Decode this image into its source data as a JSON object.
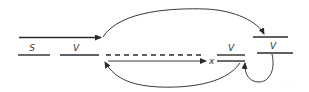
{
  "diagram": {
    "type": "syntactic-movement-diagram",
    "labels": {
      "subject": "S",
      "verb_original": "V",
      "trace_x": "x",
      "verb_target_1": "V",
      "verb_target_2": "V"
    },
    "colors": {
      "ink": "#2b2b2b",
      "background": "#ffffff"
    },
    "elements": [
      {
        "id": "incoming-arrow",
        "kind": "arrow",
        "direction": "right"
      },
      {
        "id": "s-slot",
        "kind": "line",
        "label": "S"
      },
      {
        "id": "v-slot",
        "kind": "line",
        "label": "V"
      },
      {
        "id": "dashed-gap",
        "kind": "dashed-line"
      },
      {
        "id": "x-arrow",
        "kind": "arrow",
        "direction": "right",
        "label": "x"
      },
      {
        "id": "v-slot-middle",
        "kind": "double-line",
        "label": "V"
      },
      {
        "id": "top-right-slot",
        "kind": "line"
      },
      {
        "id": "v-slot-right",
        "kind": "line",
        "label": "V"
      },
      {
        "id": "top-arc",
        "kind": "curved-arrow",
        "from": "incoming-arrow-end",
        "to": "top-right-slot"
      },
      {
        "id": "bottom-arc",
        "kind": "curved-arrow",
        "from": "v-slot-middle",
        "to": "dashed-gap-start"
      },
      {
        "id": "loop-arc",
        "kind": "curved-arrow",
        "from": "v-slot-right",
        "to": "v-slot-middle"
      }
    ]
  }
}
